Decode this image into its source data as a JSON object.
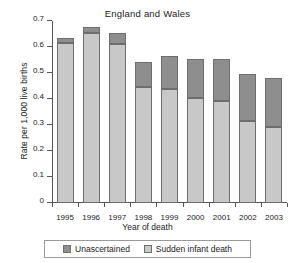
{
  "chart_data": {
    "type": "bar",
    "subtype": "stacked-bar",
    "title": "England and Wales",
    "xlabel": "Year of death",
    "ylabel": "Rate per 1,000 live births",
    "categories": [
      "1995",
      "1996",
      "1997",
      "1998",
      "1999",
      "2000",
      "2001",
      "2002",
      "2003"
    ],
    "series": [
      {
        "name": "Sudden infant death",
        "color": "#c8c8c8",
        "values": [
          0.614,
          0.655,
          0.613,
          0.447,
          0.437,
          0.405,
          0.393,
          0.316,
          0.294
        ]
      },
      {
        "name": "Unascertained",
        "color": "#8e8e8e",
        "values": [
          0.021,
          0.023,
          0.042,
          0.094,
          0.13,
          0.147,
          0.162,
          0.181,
          0.188
        ]
      }
    ],
    "totals": [
      0.635,
      0.678,
      0.655,
      0.541,
      0.567,
      0.552,
      0.555,
      0.497,
      0.482
    ],
    "ylim": [
      0,
      0.7
    ],
    "yticks": [
      "0",
      "0.1",
      "0.2",
      "0.3",
      "0.4",
      "0.5",
      "0.6",
      "0.7"
    ],
    "ytick_values": [
      0,
      0.1,
      0.2,
      0.3,
      0.4,
      0.5,
      0.6,
      0.7
    ],
    "grid": false,
    "legend_position": "bottom",
    "stack_order_bottom_to_top": [
      "Sudden infant death",
      "Unascertained"
    ]
  },
  "legend": {
    "entries": [
      {
        "label": "Unascertained",
        "color": "#8e8e8e"
      },
      {
        "label": "Sudden infant death",
        "color": "#c8c8c8"
      }
    ]
  }
}
